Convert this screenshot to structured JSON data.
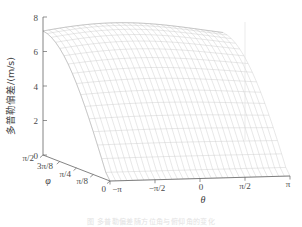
{
  "figure": {
    "kind": "3d-surface-mesh",
    "background": "#ffffff",
    "mesh_color": "#b9b9b9",
    "axis_color": "#5a5a5a",
    "text_color": "#3d3d3d"
  },
  "axes": {
    "z": {
      "label": "多普勒偏差/(m/s)",
      "ticks": [
        "0",
        "2",
        "4",
        "6",
        "8"
      ],
      "values": [
        0,
        2,
        4,
        6,
        8
      ],
      "range": [
        0,
        8
      ]
    },
    "x": {
      "label": "θ",
      "ticks": [
        "−π",
        "−π/2",
        "0",
        "π/2",
        "π"
      ],
      "values": [
        -3.1416,
        -1.5708,
        0,
        1.5708,
        3.1416
      ],
      "range": [
        -3.1416,
        3.1416
      ]
    },
    "y": {
      "label": "φ",
      "ticks": [
        "0",
        "π/8",
        "π/4",
        "3π/8",
        "π/2"
      ],
      "values": [
        0,
        0.3927,
        0.7854,
        1.1781,
        1.5708
      ],
      "range": [
        0,
        1.5708
      ]
    }
  },
  "chart_data": {
    "type": "surface",
    "title": "",
    "xlabel": "θ",
    "ylabel": "φ",
    "zlabel": "多普勒偏差/(m/s)",
    "xlim": [
      -3.1416,
      3.1416
    ],
    "ylim": [
      0,
      1.5708
    ],
    "zlim": [
      0,
      8
    ],
    "xticks": [
      -3.1416,
      -1.5708,
      0,
      1.5708,
      3.1416
    ],
    "xticklabels": [
      "−π",
      "−π/2",
      "0",
      "π/2",
      "π"
    ],
    "yticks": [
      0,
      0.3927,
      0.7854,
      1.1781,
      1.5708
    ],
    "yticklabels": [
      "0",
      "π/8",
      "π/4",
      "3π/8",
      "π/2"
    ],
    "zticks": [
      0,
      2,
      4,
      6,
      8
    ],
    "zticklabels": [
      "0",
      "2",
      "4",
      "6",
      "8"
    ],
    "grid": true,
    "legend": null,
    "mesh_nx": 33,
    "mesh_ny": 17,
    "z_at_phi_min": 0.0,
    "z_at_phi_max": 7.0,
    "surface_values": {
      "phi": [
        0,
        0.3927,
        0.7854,
        1.1781,
        1.5708
      ],
      "z_mean": [
        0.0,
        1.8,
        3.6,
        5.4,
        7.0
      ]
    }
  },
  "caption": {
    "text": "图  多普勒偏差随方位角与俯仰角的变化"
  }
}
